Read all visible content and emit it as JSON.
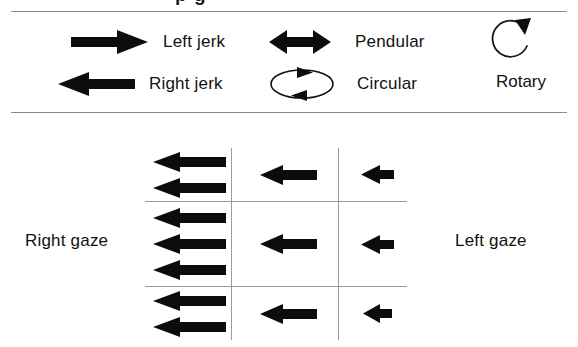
{
  "figure": {
    "cut_off_title_fragment": "p g"
  },
  "legend": {
    "items": [
      {
        "id": "left-jerk",
        "label": "Left jerk",
        "icon": "arrow-right-thick-icon"
      },
      {
        "id": "right-jerk",
        "label": "Right jerk",
        "icon": "arrow-left-thick-icon"
      },
      {
        "id": "pendular",
        "label": "Pendular",
        "icon": "double-headed-arrow-icon"
      },
      {
        "id": "circular",
        "label": "Circular",
        "icon": "ellipse-circulation-icon"
      },
      {
        "id": "rotary",
        "label": "Rotary",
        "icon": "rotary-circular-arrow-icon"
      }
    ]
  },
  "grid": {
    "left_axis_label": "Right gaze",
    "right_axis_label": "Left gaze",
    "columns": 3,
    "rows": 3,
    "cells": [
      {
        "row": 0,
        "col": 0,
        "arrow_count": 2,
        "arrow_size": "large",
        "direction": "left"
      },
      {
        "row": 0,
        "col": 1,
        "arrow_count": 1,
        "arrow_size": "medium",
        "direction": "left"
      },
      {
        "row": 0,
        "col": 2,
        "arrow_count": 1,
        "arrow_size": "small",
        "direction": "left"
      },
      {
        "row": 1,
        "col": 0,
        "arrow_count": 3,
        "arrow_size": "large",
        "direction": "left"
      },
      {
        "row": 1,
        "col": 1,
        "arrow_count": 1,
        "arrow_size": "medium",
        "direction": "left"
      },
      {
        "row": 1,
        "col": 2,
        "arrow_count": 1,
        "arrow_size": "small",
        "direction": "left"
      },
      {
        "row": 2,
        "col": 0,
        "arrow_count": 2,
        "arrow_size": "large",
        "direction": "left"
      },
      {
        "row": 2,
        "col": 1,
        "arrow_count": 1,
        "arrow_size": "medium",
        "direction": "left"
      },
      {
        "row": 2,
        "col": 2,
        "arrow_count": 1,
        "arrow_size": "small",
        "direction": "left"
      }
    ]
  },
  "colors": {
    "ink": "#111111",
    "rule": "#8a8a8a",
    "grid_line": "#9a9a9a",
    "background": "#ffffff"
  }
}
